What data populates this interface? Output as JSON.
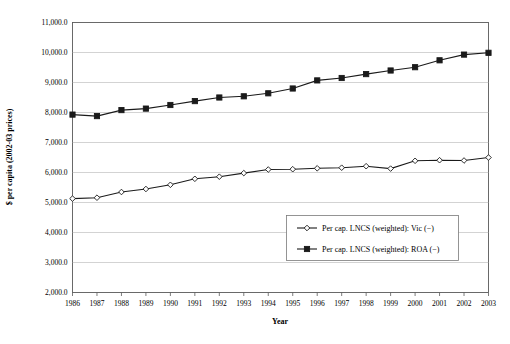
{
  "chart_data": {
    "type": "line",
    "title": "",
    "xlabel": "Year",
    "ylabel": "$ per capita (2002-03 prices)",
    "grid": true,
    "legend_position": "inside-lower-right",
    "categories": [
      "1986",
      "1987",
      "1988",
      "1989",
      "1990",
      "1991",
      "1992",
      "1993",
      "1994",
      "1995",
      "1996",
      "1997",
      "1998",
      "1999",
      "2000",
      "2001",
      "2002",
      "2003"
    ],
    "x": [
      1986,
      1987,
      1988,
      1989,
      1990,
      1991,
      1992,
      1993,
      1994,
      1995,
      1996,
      1997,
      1998,
      1999,
      2000,
      2001,
      2002,
      2003
    ],
    "xlim": [
      1986,
      2003
    ],
    "ylim": [
      2000,
      11000
    ],
    "ytick_labels": [
      "11,000.0",
      "10,000.0",
      "9,000.0",
      "8,000.0",
      "7,000.0",
      "6,000.0",
      "5,000.0",
      "4,000.0",
      "3,000.0",
      "2,000.0"
    ],
    "ytick_values": [
      11000,
      10000,
      9000,
      8000,
      7000,
      6000,
      5000,
      4000,
      3000,
      2000
    ],
    "xtick_labels": [
      "1986",
      "1987",
      "1988",
      "1989",
      "1990",
      "1991",
      "1992",
      "1993",
      "1994",
      "1995",
      "1996",
      "1997",
      "1998",
      "1999",
      "2000",
      "2001",
      "2002",
      "2003"
    ],
    "series": [
      {
        "name": "Per cap. LNCS (weighted): Vic (−)",
        "marker": "open-diamond",
        "color": "#1a1a1a",
        "values": [
          5130,
          5160,
          5350,
          5450,
          5590,
          5790,
          5860,
          5980,
          6100,
          6110,
          6140,
          6160,
          6210,
          6130,
          6390,
          6410,
          6400,
          6500
        ]
      },
      {
        "name": "Per cap. LNCS (weighted): ROA (−)",
        "marker": "filled-square",
        "color": "#1a1a1a",
        "values": [
          7930,
          7880,
          8080,
          8130,
          8250,
          8380,
          8500,
          8540,
          8640,
          8800,
          9070,
          9150,
          9280,
          9400,
          9510,
          9740,
          9930,
          9990
        ]
      }
    ]
  },
  "legend": {
    "entries": [
      {
        "label": "Per cap. LNCS (weighted): Vic (−)",
        "marker": "open-diamond"
      },
      {
        "label": "Per cap. LNCS (weighted): ROA (−)",
        "marker": "filled-square"
      }
    ]
  },
  "axes": {
    "x_title": "Year",
    "y_title": "$ per capita (2002-03 prices)"
  },
  "colors": {
    "series_line": "#1a1a1a",
    "gridline": "#b5b5b5",
    "axis": "#5a5a5a",
    "background": "#ffffff"
  }
}
